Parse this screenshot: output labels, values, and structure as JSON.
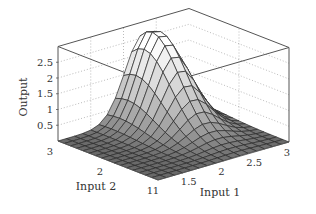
{
  "chart_data": {
    "type": "surface3d",
    "title": "",
    "xlabel": "Input 1",
    "ylabel": "Input 2",
    "zlabel": "Output",
    "xlim": [
      1,
      3
    ],
    "ylim": [
      1,
      3
    ],
    "zlim": [
      0,
      3
    ],
    "x_ticks": [
      "1",
      "1.5",
      "2",
      "2.5",
      "3"
    ],
    "y_ticks": [
      "1",
      "2",
      "3"
    ],
    "z_ticks": [
      "0.5",
      "1",
      "1.5",
      "2",
      "2.5"
    ],
    "grid": true,
    "grid_style": "dotted",
    "mesh": {
      "x_points": 17,
      "y_points": 17
    },
    "peak": {
      "input1": 2.3,
      "input2": 2.75,
      "output": 2.9
    },
    "baseline_output": 0.0,
    "colormap": "gray"
  }
}
